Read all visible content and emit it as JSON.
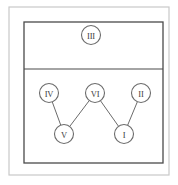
{
  "figure": {
    "title": "",
    "background_color": "#ffffff",
    "outer_frame": {
      "name": "outer-frame",
      "x": 9,
      "y": 7,
      "width": 160,
      "height": 168,
      "stroke": "#c9c9c9",
      "stroke_width": 1.2
    },
    "inner_frame": {
      "name": "inner-frame",
      "x": 24,
      "y": 22,
      "width": 139,
      "height": 141,
      "stroke": "#4a4a4a",
      "stroke_width": 1.3
    },
    "divider": {
      "name": "horizontal-divider",
      "x1": 24,
      "y1": 69,
      "x2": 163,
      "y2": 69,
      "stroke": "#4a4a4a",
      "stroke_width": 1.2
    },
    "node_style": {
      "radius": 9.5,
      "stroke": "#6b6b6b",
      "stroke_width": 1.1,
      "fill": "#ffffff",
      "text_color": "#3c3c3c"
    },
    "edge_style": {
      "stroke": "#6b6b6b",
      "stroke_width": 1.0
    },
    "nodes": [
      {
        "id": "III",
        "label": "III",
        "cx": 91,
        "cy": 35,
        "region": "upper"
      },
      {
        "id": "IV",
        "label": "IV",
        "cx": 49,
        "cy": 93,
        "region": "lower"
      },
      {
        "id": "VI",
        "label": "VI",
        "cx": 95,
        "cy": 93,
        "region": "lower"
      },
      {
        "id": "II",
        "label": "II",
        "cx": 141,
        "cy": 93,
        "region": "lower"
      },
      {
        "id": "V",
        "label": "V",
        "cx": 64,
        "cy": 134,
        "region": "lower"
      },
      {
        "id": "I",
        "label": "I",
        "cx": 124,
        "cy": 134,
        "region": "lower"
      }
    ],
    "edges": [
      {
        "from": "IV",
        "to": "V"
      },
      {
        "from": "VI",
        "to": "V"
      },
      {
        "from": "VI",
        "to": "I"
      },
      {
        "from": "II",
        "to": "I"
      }
    ]
  }
}
